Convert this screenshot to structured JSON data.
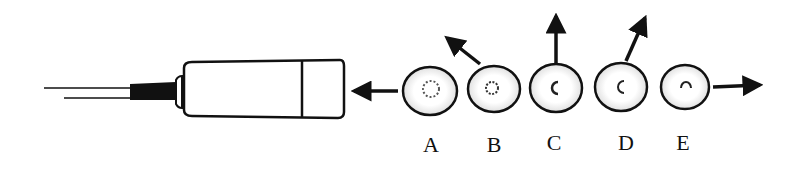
{
  "diagram": {
    "instrument": "micropipette",
    "cells": [
      {
        "label": "A",
        "arrow": "left-toward-pipette"
      },
      {
        "label": "B",
        "arrow": "up-left"
      },
      {
        "label": "C",
        "arrow": "up"
      },
      {
        "label": "D",
        "arrow": "up-right"
      },
      {
        "label": "E",
        "arrow": "right"
      }
    ]
  }
}
